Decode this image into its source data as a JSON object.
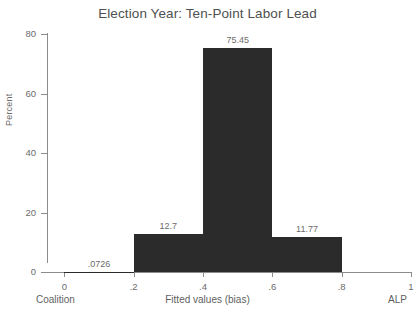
{
  "chart_data": {
    "type": "bar",
    "title": "Election Year: Ten-Point Labor Lead",
    "xlabel": "Fitted values (bias)",
    "ylabel": "Percent",
    "categories": [
      "0 - .2",
      ".2 - .4",
      ".4 - .6",
      ".6 - .8"
    ],
    "bin_starts": [
      0,
      0.2,
      0.4,
      0.6
    ],
    "bin_width": 0.2,
    "values": [
      0.0726,
      12.7,
      75.45,
      11.77
    ],
    "value_labels": [
      ".0726",
      "12.7",
      "75.45",
      "11.77"
    ],
    "xlim": [
      -0.05,
      1.0
    ],
    "ylim": [
      0,
      80
    ],
    "ytick_values": [
      0,
      20,
      40,
      60,
      80
    ],
    "ytick_labels": [
      "0",
      "20",
      "40",
      "60",
      "80"
    ],
    "xtick_values": [
      0,
      0.2,
      0.4,
      0.6,
      0.8,
      1
    ],
    "xtick_labels": [
      "0",
      ".2",
      ".4",
      ".6",
      ".8",
      "1"
    ],
    "grid": false,
    "legend": "none",
    "bar_color": "#2b2b2b",
    "background_color": "#ffffff",
    "axis_color": "#8c8c8c",
    "text_color": "#6b6b6b",
    "axis_endpoint_left": "Coalition",
    "axis_endpoint_right": "ALP"
  }
}
